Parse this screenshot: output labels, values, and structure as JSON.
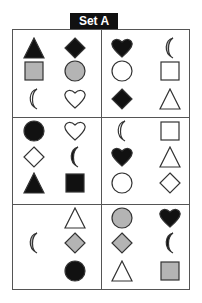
{
  "title": "Set A",
  "colors": {
    "black": "#111111",
    "grey": "#b4b4b4",
    "outline": "#333333",
    "white": "#ffffff"
  },
  "cells": [
    {
      "id": "r1c1",
      "shapes": [
        {
          "type": "triangle",
          "fill": "black",
          "x": 23,
          "y": 37
        },
        {
          "type": "diamond",
          "fill": "black",
          "x": 64,
          "y": 37
        },
        {
          "type": "square",
          "fill": "grey",
          "x": 23,
          "y": 60
        },
        {
          "type": "circle",
          "fill": "grey",
          "x": 64,
          "y": 60
        },
        {
          "type": "crescent",
          "fill": "white",
          "x": 23,
          "y": 88
        },
        {
          "type": "heart",
          "fill": "white",
          "x": 64,
          "y": 88
        }
      ]
    },
    {
      "id": "r1c2",
      "shapes": [
        {
          "type": "heart",
          "fill": "black",
          "x": 111,
          "y": 37
        },
        {
          "type": "crescent",
          "fill": "grey",
          "x": 159,
          "y": 37
        },
        {
          "type": "circle",
          "fill": "white",
          "x": 111,
          "y": 60
        },
        {
          "type": "square",
          "fill": "white",
          "x": 159,
          "y": 60
        },
        {
          "type": "diamond",
          "fill": "black",
          "x": 111,
          "y": 88
        },
        {
          "type": "triangle",
          "fill": "white",
          "x": 159,
          "y": 88
        }
      ]
    },
    {
      "id": "r2c1",
      "shapes": [
        {
          "type": "circle",
          "fill": "black",
          "x": 23,
          "y": 120
        },
        {
          "type": "heart",
          "fill": "white",
          "x": 64,
          "y": 120
        },
        {
          "type": "diamond",
          "fill": "white",
          "x": 23,
          "y": 146
        },
        {
          "type": "crescent",
          "fill": "black",
          "x": 64,
          "y": 146
        },
        {
          "type": "triangle",
          "fill": "black",
          "x": 23,
          "y": 172
        },
        {
          "type": "square",
          "fill": "black",
          "x": 64,
          "y": 172
        }
      ]
    },
    {
      "id": "r2c2",
      "shapes": [
        {
          "type": "crescent",
          "fill": "white",
          "x": 111,
          "y": 120
        },
        {
          "type": "square",
          "fill": "white",
          "x": 159,
          "y": 120
        },
        {
          "type": "heart",
          "fill": "black",
          "x": 111,
          "y": 146
        },
        {
          "type": "triangle",
          "fill": "white",
          "x": 159,
          "y": 146
        },
        {
          "type": "circle",
          "fill": "white",
          "x": 111,
          "y": 172
        },
        {
          "type": "diamond",
          "fill": "white",
          "x": 159,
          "y": 172
        }
      ]
    },
    {
      "id": "r3c1",
      "shapes": [
        {
          "type": "triangle",
          "fill": "white",
          "x": 64,
          "y": 207
        },
        {
          "type": "crescent",
          "fill": "grey",
          "x": 23,
          "y": 232
        },
        {
          "type": "diamond",
          "fill": "grey",
          "x": 64,
          "y": 232
        },
        {
          "type": "circle",
          "fill": "black",
          "x": 64,
          "y": 260
        }
      ]
    },
    {
      "id": "r3c2",
      "shapes": [
        {
          "type": "circle",
          "fill": "grey",
          "x": 111,
          "y": 207
        },
        {
          "type": "heart",
          "fill": "black",
          "x": 159,
          "y": 207
        },
        {
          "type": "diamond",
          "fill": "grey",
          "x": 111,
          "y": 232
        },
        {
          "type": "crescent",
          "fill": "black",
          "x": 159,
          "y": 232
        },
        {
          "type": "triangle",
          "fill": "white",
          "x": 111,
          "y": 260
        },
        {
          "type": "square",
          "fill": "grey",
          "x": 159,
          "y": 260
        }
      ]
    }
  ]
}
